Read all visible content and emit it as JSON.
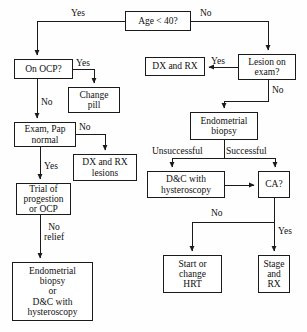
{
  "diagram": {
    "colors": {
      "background": "#fefefe",
      "box_border": "#1a1a1a",
      "box_fill": "#ffffff",
      "line": "#1a1a1a",
      "text": "#101010"
    },
    "nodes": [
      {
        "id": "age",
        "label": "Age < 40?",
        "x": 125,
        "y": 11,
        "w": 66,
        "h": 20
      },
      {
        "id": "on_ocp",
        "label": "On OCP?",
        "x": 14,
        "y": 59,
        "w": 59,
        "h": 20
      },
      {
        "id": "change_pill",
        "label": "Change\npill",
        "x": 68,
        "y": 87,
        "w": 52,
        "h": 26
      },
      {
        "id": "exam_pap",
        "label": "Exam, Pap\nnormal",
        "x": 14,
        "y": 122,
        "w": 62,
        "h": 25
      },
      {
        "id": "dx_rx_lesions",
        "label": "DX and RX\nlesions",
        "x": 73,
        "y": 154,
        "w": 64,
        "h": 27
      },
      {
        "id": "trial_prog",
        "label": "Trial of\nprogestion\nor OCP",
        "x": 16,
        "y": 183,
        "w": 55,
        "h": 32
      },
      {
        "id": "endo_or_dc",
        "label": "Endometrial\nbiopsy\nor\nD&C with\nhysteroscopy",
        "x": 12,
        "y": 262,
        "w": 81,
        "h": 59
      },
      {
        "id": "lesion_exam",
        "label": "Lesion on\nexam?",
        "x": 238,
        "y": 54,
        "w": 58,
        "h": 26
      },
      {
        "id": "dx_rx",
        "label": "DX and RX",
        "x": 145,
        "y": 57,
        "w": 60,
        "h": 19
      },
      {
        "id": "endo_biopsy",
        "label": "Endometrial\nbiopsy",
        "x": 190,
        "y": 112,
        "w": 68,
        "h": 28
      },
      {
        "id": "dc_hystero",
        "label": "D&C with\nhysteroscopy",
        "x": 147,
        "y": 171,
        "w": 78,
        "h": 27
      },
      {
        "id": "ca",
        "label": "CA?",
        "x": 258,
        "y": 171,
        "w": 32,
        "h": 27
      },
      {
        "id": "start_hrt",
        "label": "Start or\nchange\nHRT",
        "x": 163,
        "y": 255,
        "w": 59,
        "h": 38
      },
      {
        "id": "stage_rx",
        "label": "Stage\nand\nRX",
        "x": 258,
        "y": 255,
        "w": 32,
        "h": 38
      }
    ],
    "edge_labels": [
      {
        "id": "yes-age-left",
        "text": "Yes",
        "x": 71,
        "y": 8
      },
      {
        "id": "no-age-right",
        "text": "No",
        "x": 200,
        "y": 8
      },
      {
        "id": "yes-ocp",
        "text": "Yes",
        "x": 76,
        "y": 58
      },
      {
        "id": "no-ocp",
        "text": "No",
        "x": 41,
        "y": 97
      },
      {
        "id": "no-exam-pap",
        "text": "No",
        "x": 79,
        "y": 122
      },
      {
        "id": "yes-exam-pap",
        "text": "Yes",
        "x": 44,
        "y": 161
      },
      {
        "id": "no-relief",
        "text": "No\nrelief",
        "x": 44,
        "y": 222
      },
      {
        "id": "yes-lesion",
        "text": "Yes",
        "x": 211,
        "y": 56
      },
      {
        "id": "no-lesion",
        "text": "No",
        "x": 268,
        "y": 88
      },
      {
        "id": "unsuccessful",
        "text": "Unsuccessful",
        "x": 152,
        "y": 146
      },
      {
        "id": "successful",
        "text": "Successful",
        "x": 222,
        "y": 146
      },
      {
        "id": "no-ca",
        "text": "No",
        "x": 211,
        "y": 210
      },
      {
        "id": "yes-ca",
        "text": "Yes",
        "x": 276,
        "y": 226
      }
    ]
  }
}
